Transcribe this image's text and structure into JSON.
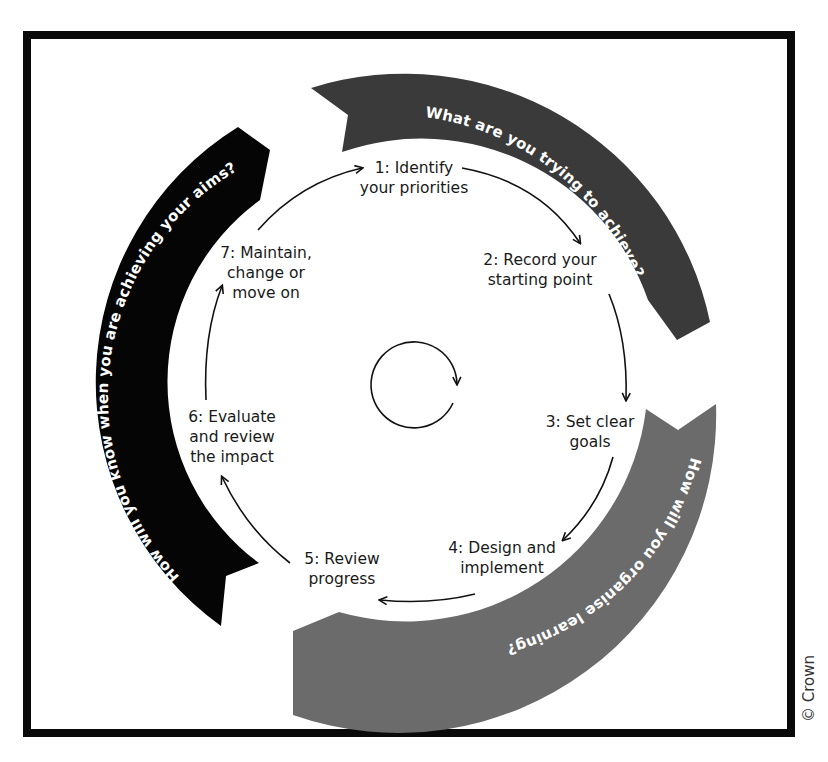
{
  "diagram": {
    "center_icon": "clockwise-cycle-arrow",
    "steps": [
      {
        "number": 1,
        "lines": [
          "1: Identify",
          "your priorities"
        ]
      },
      {
        "number": 2,
        "lines": [
          "2: Record your",
          "starting point"
        ]
      },
      {
        "number": 3,
        "lines": [
          "3: Set clear",
          "goals"
        ]
      },
      {
        "number": 4,
        "lines": [
          "4: Design and",
          "implement"
        ]
      },
      {
        "number": 5,
        "lines": [
          "5: Review",
          "progress"
        ]
      },
      {
        "number": 6,
        "lines": [
          "6: Evaluate",
          "and review",
          "the impact"
        ]
      },
      {
        "number": 7,
        "lines": [
          "7: Maintain,",
          "change or",
          "move on"
        ]
      }
    ],
    "bands": [
      {
        "id": "top",
        "text": "What are you trying to achieve?",
        "color": "#3a3a3a"
      },
      {
        "id": "bottom",
        "text": "How will you organise learning?",
        "color": "#6b6b6b"
      },
      {
        "id": "left",
        "text": "How will you know when you are achieving your aims?",
        "color": "#050505"
      }
    ]
  },
  "copyright": "© Crown",
  "colors": {
    "frame": "#0a0a0a",
    "text": "#1a1a1a",
    "arrow": "#111111",
    "band_text": "#ffffff"
  }
}
